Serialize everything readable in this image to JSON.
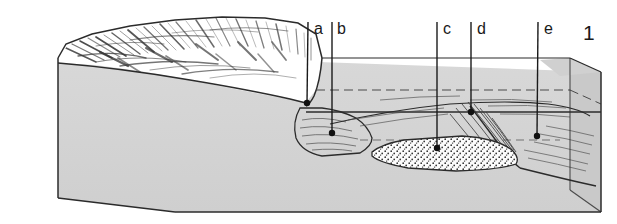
{
  "figure": {
    "number": "1",
    "kind": "geological-block-diagram",
    "caption_text": ""
  },
  "colors": {
    "block_face": "#d4d4d4",
    "block_top": "#d0d0d0",
    "block_side": "#c9c9c9",
    "outline": "#2b2b2b",
    "hachure": "#3a3a3a",
    "stipple": "#2e2e2e",
    "deposit_fill": "#fbfbfb",
    "hillslope_fill": "#ffffff",
    "label_text": "#1a1a1a",
    "background": "#ffffff"
  },
  "leaders": [
    {
      "id": "a",
      "label": "a",
      "label_x": 314,
      "label_y": 34,
      "line_x": 308,
      "line_top": 22,
      "dot_x": 307,
      "dot_y": 103
    },
    {
      "id": "b",
      "label": "b",
      "label_x": 337,
      "label_y": 34,
      "line_x": 332,
      "line_top": 22,
      "dot_x": 332,
      "dot_y": 133
    },
    {
      "id": "c",
      "label": "c",
      "label_x": 434,
      "label_y": 34,
      "line_x": 437,
      "line_top": 22,
      "dot_x": 437,
      "dot_y": 148
    },
    {
      "id": "d",
      "label": "d",
      "label_x": 471,
      "label_y": 34,
      "line_x": 471,
      "line_top": 22,
      "dot_x": 471,
      "dot_y": 112
    },
    {
      "id": "e",
      "label": "e",
      "label_x": 536,
      "label_y": 34,
      "line_x": 538,
      "line_top": 22,
      "dot_x": 537,
      "dot_y": 136
    }
  ],
  "figure_number_pos": {
    "x": 583,
    "y": 40
  },
  "block": {
    "front_top_left": {
      "x": 58,
      "y": 58
    },
    "front_bottom_left": {
      "x": 58,
      "y": 198
    },
    "front_bottom_right": {
      "x": 601,
      "y": 212
    },
    "bottom_corner": {
      "x": 175,
      "y": 212
    },
    "top_right": {
      "x": 601,
      "y": 72
    },
    "back_top_right": {
      "x": 570,
      "y": 58
    }
  },
  "features": [
    {
      "name": "hachured-hillslope",
      "description": "upland surface with hachure shading"
    },
    {
      "name": "stippled-alluvial-deposit",
      "description": "dotted sediment fill in valley floor"
    },
    {
      "name": "terrace-surface",
      "description": "low-angle terrace between slope and valley"
    },
    {
      "name": "hidden-back-edge-dashed",
      "description": "dashed construction line marking hidden block back edge"
    }
  ]
}
